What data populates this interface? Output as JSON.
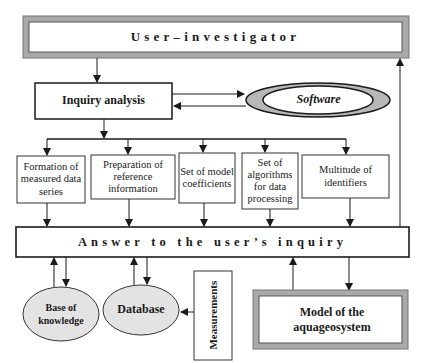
{
  "diagram": {
    "user_investigator": {
      "label": "User–investigator"
    },
    "inquiry_analysis": {
      "label": "Inquiry analysis"
    },
    "software": {
      "label": "Software"
    },
    "process_boxes": [
      {
        "label": "Formation of measured data series"
      },
      {
        "label": "Preparation of reference information"
      },
      {
        "label": "Set of model coefficients"
      },
      {
        "label": "Set of algorithms for data processing"
      },
      {
        "label": "Multitude of identifiers"
      }
    ],
    "answer": {
      "label": "Answer to the user’s inquiry"
    },
    "base_of_knowledge": {
      "label": "Base of knowledge"
    },
    "database": {
      "label": "Database"
    },
    "measurements": {
      "label": "Measurements"
    },
    "model": {
      "label": "Model of the aquageosystem"
    }
  },
  "colors": {
    "frame_gray": "#a9a9a9",
    "ellipse_fill": "#e3e3e3",
    "line": "#1a1a1a"
  }
}
